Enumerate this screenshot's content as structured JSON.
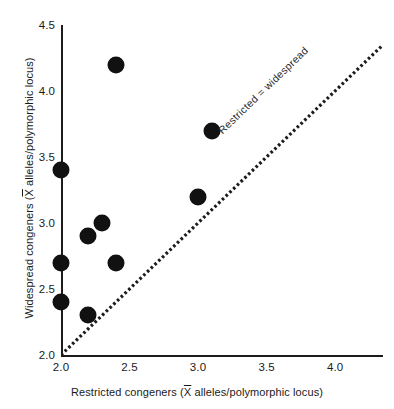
{
  "chart_data": {
    "type": "scatter",
    "title": "",
    "xlabel": "Restricted congeners (X̄ alleles/polymorphic locus)",
    "ylabel": "Widespread congeners (X̄ alleles/polymorphic locus)",
    "xlim": [
      2.0,
      4.35
    ],
    "ylim": [
      2.0,
      4.5
    ],
    "xticks": [
      "2.0",
      "2.5",
      "3.0",
      "3.5",
      "4.0"
    ],
    "xtick_values": [
      2.0,
      2.5,
      3.0,
      3.5,
      4.0
    ],
    "yticks": [
      "2.0",
      "2.5",
      "3.0",
      "3.5",
      "4.0",
      "4.5"
    ],
    "ytick_values": [
      2.0,
      2.5,
      3.0,
      3.5,
      4.0,
      4.5
    ],
    "grid": false,
    "legend": "none",
    "marker": {
      "shape": "circle",
      "color": "#111111",
      "size": 17
    },
    "points": [
      {
        "x": 2.4,
        "y": 4.2
      },
      {
        "x": 3.1,
        "y": 3.7
      },
      {
        "x": 2.0,
        "y": 3.4
      },
      {
        "x": 3.0,
        "y": 3.2
      },
      {
        "x": 2.3,
        "y": 3.0
      },
      {
        "x": 2.2,
        "y": 2.9
      },
      {
        "x": 2.4,
        "y": 2.7
      },
      {
        "x": 2.0,
        "y": 2.7
      },
      {
        "x": 2.0,
        "y": 2.4
      },
      {
        "x": 2.2,
        "y": 2.3
      }
    ],
    "reference_line": {
      "label": "Restricted = widespread",
      "style": "dotted",
      "color": "#1c1c1c",
      "from": [
        2.0,
        2.0
      ],
      "to": [
        4.35,
        4.35
      ]
    }
  },
  "axes": {
    "x_title": "Restricted congeners (X̄ alleles/polymorphic locus)",
    "y_title": "Widespread congeners (X̄ alleles/polymorphic locus)"
  }
}
